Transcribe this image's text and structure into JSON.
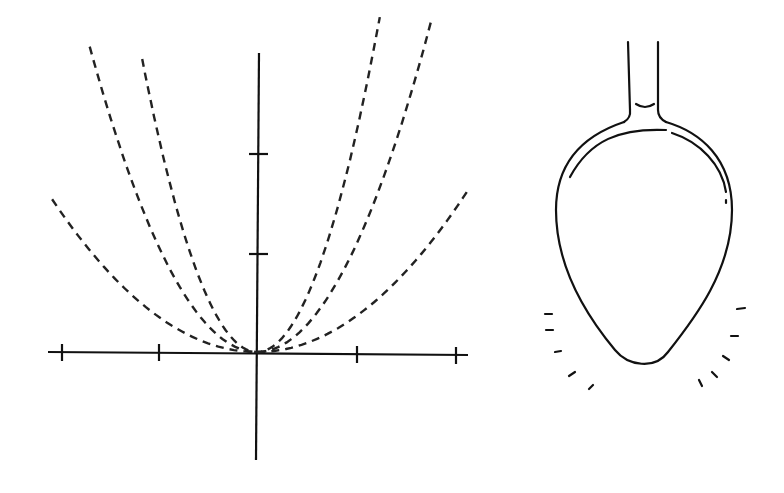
{
  "figure": {
    "colors": {
      "stroke": "#111111",
      "background": "#ffffff"
    }
  },
  "plot": {
    "origin_px": [
      257,
      352
    ],
    "unit_px": 99,
    "x_ticks": [
      -2,
      -1,
      1,
      2
    ],
    "y_ticks": [
      1,
      2
    ],
    "curves": [
      {
        "name": "outer",
        "a": 0.36,
        "x_range": [
          -2.07,
          2.13
        ]
      },
      {
        "name": "middle",
        "a": 1.08,
        "x_range": [
          -1.69,
          1.77
        ]
      },
      {
        "name": "inner",
        "a": 2.2,
        "x_range": [
          -1.16,
          1.24
        ]
      }
    ],
    "line_style": "dashed"
  },
  "spoon": {
    "label": "",
    "strokes_count": 10
  }
}
